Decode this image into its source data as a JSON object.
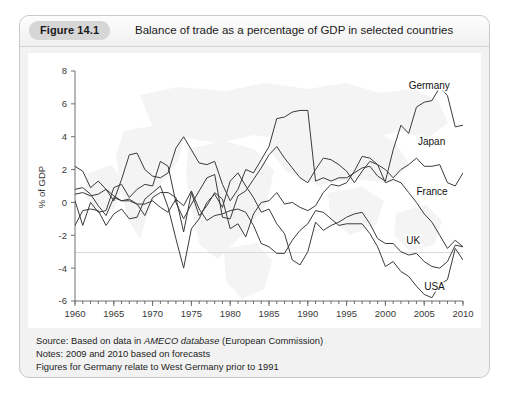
{
  "figure": {
    "badge": "Figure 14.1",
    "title": "Balance of trade as a percentage of GDP in selected countries"
  },
  "notes": {
    "source_prefix": "Source: Based on data in ",
    "source_italic": "AMECO database",
    "source_suffix": " (European Commission)",
    "note1": "Notes: 2009 and 2010 based on forecasts",
    "note2": "Figures for Germany relate to West Germany prior to 1991"
  },
  "chart_data": {
    "type": "line",
    "title": "Balance of trade as a percentage of GDP in selected countries",
    "xlabel": "",
    "ylabel": "% of GDP",
    "xlim": [
      1960,
      2010
    ],
    "ylim": [
      -6,
      8
    ],
    "ytick_values": [
      8,
      6,
      4,
      2,
      0,
      -2,
      -4,
      -6
    ],
    "ytick_labels": [
      "8",
      "6",
      "4",
      "2",
      "0",
      "-2",
      "-4",
      "-6"
    ],
    "xtick_labels": [
      "1960",
      "1965",
      "1970",
      "1975",
      "1980",
      "1985",
      "1990",
      "1995",
      "2000",
      "2005",
      "2010"
    ],
    "xtick_values": [
      1960,
      1965,
      1970,
      1975,
      1980,
      1985,
      1990,
      1995,
      2000,
      2005,
      2010
    ],
    "minor_xtick_step": 1,
    "grid": false,
    "legend": "inline-right-labels",
    "line_color": "#3b3b3b",
    "background_watermark": "world-map",
    "x": [
      1960,
      1961,
      1962,
      1963,
      1964,
      1965,
      1966,
      1967,
      1968,
      1969,
      1970,
      1971,
      1972,
      1973,
      1974,
      1975,
      1976,
      1977,
      1978,
      1979,
      1980,
      1981,
      1982,
      1983,
      1984,
      1985,
      1986,
      1987,
      1988,
      1989,
      1990,
      1991,
      1992,
      1993,
      1994,
      1995,
      1996,
      1997,
      1998,
      1999,
      2000,
      2001,
      2002,
      2003,
      2004,
      2005,
      2006,
      2007,
      2008,
      2009,
      2010
    ],
    "series": [
      {
        "name": "Germany",
        "label": "Germany",
        "values": [
          2.2,
          1.9,
          0.9,
          1.3,
          0.8,
          0.1,
          1.4,
          2.9,
          3.0,
          2.0,
          1.6,
          1.5,
          1.8,
          3.3,
          4.0,
          3.2,
          2.4,
          2.3,
          2.5,
          1.1,
          0.1,
          0.8,
          2.0,
          1.8,
          2.6,
          3.4,
          5.1,
          5.2,
          5.5,
          5.6,
          5.6,
          1.3,
          1.5,
          1.3,
          1.5,
          1.5,
          1.8,
          2.1,
          2.2,
          1.6,
          1.3,
          3.2,
          4.7,
          4.2,
          5.8,
          6.1,
          6.2,
          7.0,
          6.5,
          4.6,
          4.7
        ]
      },
      {
        "name": "Japan",
        "label": "Japan",
        "values": [
          0.1,
          -1.4,
          0.0,
          -0.6,
          -0.5,
          0.9,
          1.1,
          0.3,
          0.8,
          1.1,
          1.0,
          2.5,
          2.2,
          0.0,
          -1.0,
          -0.1,
          0.7,
          1.5,
          1.7,
          -0.9,
          -1.0,
          0.4,
          0.7,
          1.4,
          2.1,
          2.9,
          3.4,
          2.7,
          2.1,
          1.5,
          1.2,
          2.0,
          2.7,
          2.6,
          2.3,
          1.9,
          1.2,
          1.9,
          2.5,
          2.3,
          2.0,
          1.5,
          2.0,
          2.3,
          2.7,
          2.2,
          2.2,
          2.3,
          1.2,
          1.0,
          1.8
        ]
      },
      {
        "name": "France",
        "label": "France",
        "values": [
          0.8,
          0.9,
          0.5,
          -0.2,
          -0.8,
          0.3,
          0.1,
          0.2,
          -0.1,
          -0.8,
          0.3,
          0.6,
          0.6,
          0.3,
          -1.8,
          0.6,
          -0.8,
          -0.2,
          0.6,
          0.2,
          -1.6,
          -1.3,
          -2.1,
          -0.7,
          0.0,
          0.1,
          0.6,
          -0.1,
          0.0,
          -0.3,
          -0.5,
          -0.2,
          0.6,
          1.1,
          1.0,
          1.2,
          1.9,
          2.8,
          2.7,
          2.3,
          1.2,
          1.4,
          1.2,
          0.6,
          0.0,
          -0.7,
          -1.2,
          -2.0,
          -2.8,
          -2.3,
          -2.7
        ]
      },
      {
        "name": "UK",
        "label": "UK",
        "values": [
          -1.4,
          -0.5,
          -0.4,
          -0.5,
          -1.4,
          -0.7,
          -0.4,
          -1.0,
          -0.9,
          0.2,
          0.6,
          1.0,
          -0.3,
          -2.2,
          -4.0,
          -1.6,
          -1.0,
          0.0,
          0.5,
          -0.3,
          1.3,
          1.8,
          1.0,
          0.3,
          -0.6,
          -0.4,
          -1.3,
          -1.9,
          -3.5,
          -3.8,
          -3.0,
          -1.2,
          -1.7,
          -1.4,
          -1.2,
          -0.9,
          -0.7,
          -0.6,
          -1.3,
          -2.2,
          -2.5,
          -2.5,
          -3.0,
          -3.2,
          -3.1,
          -3.6,
          -3.9,
          -4.0,
          -3.6,
          -2.6,
          -2.7
        ]
      },
      {
        "name": "USA",
        "label": "USA",
        "values": [
          0.5,
          0.6,
          0.4,
          0.5,
          0.8,
          0.4,
          0.1,
          0.1,
          -0.1,
          -0.1,
          0.1,
          -0.3,
          -0.6,
          0.2,
          -0.2,
          0.7,
          -0.4,
          -1.1,
          -0.8,
          -0.7,
          -0.5,
          -0.4,
          -0.6,
          -1.4,
          -2.5,
          -2.7,
          -3.1,
          -3.1,
          -2.3,
          -1.7,
          -1.3,
          -0.5,
          -0.6,
          -1.0,
          -1.4,
          -1.3,
          -1.3,
          -1.3,
          -1.9,
          -2.7,
          -3.9,
          -3.6,
          -4.2,
          -4.5,
          -5.1,
          -5.6,
          -5.8,
          -5.0,
          -4.7,
          -2.8,
          -3.5
        ]
      }
    ],
    "series_label_positions": [
      {
        "name": "Germany",
        "x": 2003.0,
        "y": 6.9
      },
      {
        "name": "Japan",
        "x": 2004.2,
        "y": 3.5
      },
      {
        "name": "France",
        "x": 2004.0,
        "y": 0.45
      },
      {
        "name": "UK",
        "x": 2002.7,
        "y": -2.55
      },
      {
        "name": "USA",
        "x": 2005.0,
        "y": -5.3
      }
    ]
  }
}
